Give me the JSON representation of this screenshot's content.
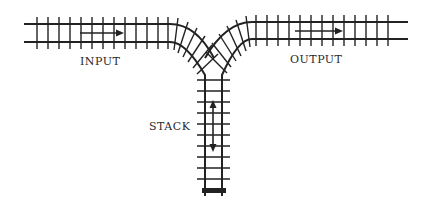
{
  "diagram": {
    "type": "railway-stack-analogy",
    "labels": {
      "input": "INPUT",
      "output": "OUTPUT",
      "stack": "STACK"
    },
    "arrows": {
      "input": "right",
      "output": "right",
      "stack": "up-down"
    },
    "colors": {
      "track": "#222222",
      "background": "#ffffff"
    }
  }
}
